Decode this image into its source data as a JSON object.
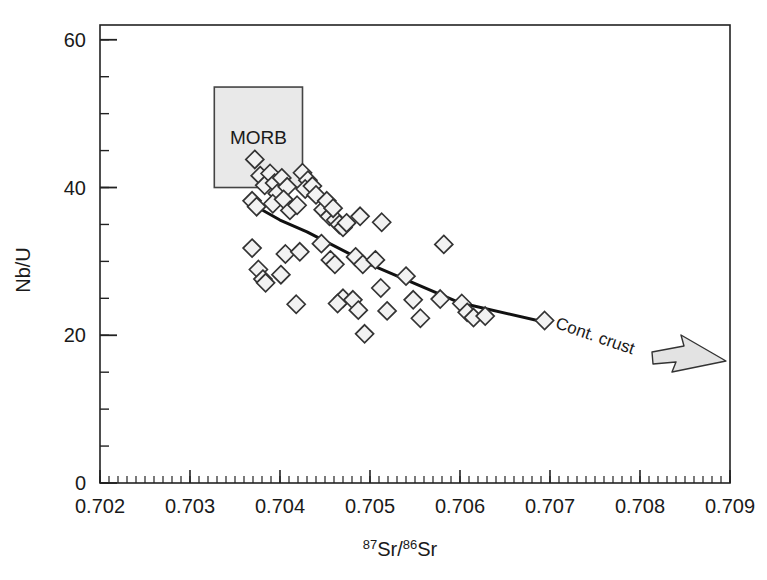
{
  "chart_data": {
    "type": "scatter",
    "title": "",
    "xlabel": "87Sr/86Sr",
    "xlabel_parts": {
      "sup1": "87",
      "base1": "Sr/",
      "sup2": "86",
      "base2": "Sr"
    },
    "ylabel": "Nb/U",
    "xlim": [
      0.702,
      0.709
    ],
    "ylim": [
      0,
      62
    ],
    "x_ticks": [
      0.702,
      0.703,
      0.704,
      0.705,
      0.706,
      0.707,
      0.708,
      0.709
    ],
    "x_tick_labels": [
      "0.702",
      "0.703",
      "0.704",
      "0.705",
      "0.706",
      "0.707",
      "0.708",
      "0.709"
    ],
    "x_minor_step": 0.0001,
    "y_ticks": [
      0,
      20,
      40,
      60
    ],
    "y_tick_labels": [
      "0",
      "20",
      "40",
      "60"
    ],
    "y_minor_step": 5,
    "grid": false,
    "legend": null,
    "marker": "open-diamond",
    "marker_edge_color": "#333333",
    "marker_fill_color": "#f2f2f2",
    "points": [
      {
        "x": 0.70372,
        "y": 43.8
      },
      {
        "x": 0.70378,
        "y": 41.6
      },
      {
        "x": 0.70383,
        "y": 40.3
      },
      {
        "x": 0.70369,
        "y": 38.2
      },
      {
        "x": 0.70374,
        "y": 37.4
      },
      {
        "x": 0.70389,
        "y": 41.9
      },
      {
        "x": 0.70394,
        "y": 40.6
      },
      {
        "x": 0.70397,
        "y": 39.2
      },
      {
        "x": 0.70392,
        "y": 37.8
      },
      {
        "x": 0.70402,
        "y": 41.3
      },
      {
        "x": 0.70408,
        "y": 40.1
      },
      {
        "x": 0.70404,
        "y": 38.4
      },
      {
        "x": 0.70411,
        "y": 36.9
      },
      {
        "x": 0.70425,
        "y": 42.0
      },
      {
        "x": 0.70431,
        "y": 41.0
      },
      {
        "x": 0.70428,
        "y": 39.8
      },
      {
        "x": 0.70436,
        "y": 40.2
      },
      {
        "x": 0.7044,
        "y": 39.0
      },
      {
        "x": 0.70419,
        "y": 37.6
      },
      {
        "x": 0.70448,
        "y": 37.0
      },
      {
        "x": 0.70455,
        "y": 36.1
      },
      {
        "x": 0.70462,
        "y": 35.6
      },
      {
        "x": 0.70466,
        "y": 35.0
      },
      {
        "x": 0.7047,
        "y": 34.6
      },
      {
        "x": 0.70474,
        "y": 35.2
      },
      {
        "x": 0.70452,
        "y": 38.2
      },
      {
        "x": 0.70459,
        "y": 37.2
      },
      {
        "x": 0.70369,
        "y": 31.8
      },
      {
        "x": 0.70376,
        "y": 28.9
      },
      {
        "x": 0.70381,
        "y": 27.6
      },
      {
        "x": 0.70384,
        "y": 27.1
      },
      {
        "x": 0.70406,
        "y": 31.0
      },
      {
        "x": 0.70401,
        "y": 28.2
      },
      {
        "x": 0.70422,
        "y": 31.3
      },
      {
        "x": 0.70418,
        "y": 24.2
      },
      {
        "x": 0.70446,
        "y": 32.4
      },
      {
        "x": 0.70456,
        "y": 30.2
      },
      {
        "x": 0.70461,
        "y": 29.6
      },
      {
        "x": 0.7047,
        "y": 25.0
      },
      {
        "x": 0.70464,
        "y": 24.3
      },
      {
        "x": 0.70489,
        "y": 36.1
      },
      {
        "x": 0.70484,
        "y": 30.6
      },
      {
        "x": 0.70492,
        "y": 29.6
      },
      {
        "x": 0.70481,
        "y": 24.8
      },
      {
        "x": 0.70487,
        "y": 23.4
      },
      {
        "x": 0.70494,
        "y": 20.2
      },
      {
        "x": 0.70513,
        "y": 35.3
      },
      {
        "x": 0.70506,
        "y": 30.2
      },
      {
        "x": 0.70512,
        "y": 26.4
      },
      {
        "x": 0.70519,
        "y": 23.3
      },
      {
        "x": 0.7054,
        "y": 28.0
      },
      {
        "x": 0.70548,
        "y": 24.8
      },
      {
        "x": 0.70556,
        "y": 22.3
      },
      {
        "x": 0.70582,
        "y": 32.3
      },
      {
        "x": 0.70578,
        "y": 24.9
      },
      {
        "x": 0.70602,
        "y": 24.3
      },
      {
        "x": 0.70608,
        "y": 23.1
      },
      {
        "x": 0.70615,
        "y": 22.4
      },
      {
        "x": 0.70628,
        "y": 22.6
      },
      {
        "x": 0.70694,
        "y": 22.0
      }
    ],
    "trend_line": {
      "label": "Cont. crust",
      "color": "#111111",
      "width": 3,
      "vertices": [
        {
          "x": 0.70368,
          "y": 37.8
        },
        {
          "x": 0.704,
          "y": 35.6
        },
        {
          "x": 0.7043,
          "y": 34.0
        },
        {
          "x": 0.705,
          "y": 29.6
        },
        {
          "x": 0.706,
          "y": 24.4
        },
        {
          "x": 0.70697,
          "y": 21.7
        }
      ]
    },
    "annotations": [
      {
        "name": "morb-field",
        "kind": "shaded-box",
        "label": "MORB",
        "x_range": [
          0.70327,
          0.70425
        ],
        "y_range": [
          40.0,
          53.6
        ],
        "fill": "#e9e9e9",
        "stroke": "#444444"
      },
      {
        "name": "cont-crust-label",
        "kind": "rotated-text",
        "label": "Cont. crust",
        "x": 0.70705,
        "y": 21.0,
        "rotation_deg": 19
      },
      {
        "name": "direction-arrow",
        "kind": "arrow",
        "label": "",
        "points_to": "right",
        "fill": "#e3e3e3",
        "stroke": "#333333"
      }
    ]
  },
  "figure": {
    "background": "#ffffff",
    "frame_color": "#222222"
  }
}
